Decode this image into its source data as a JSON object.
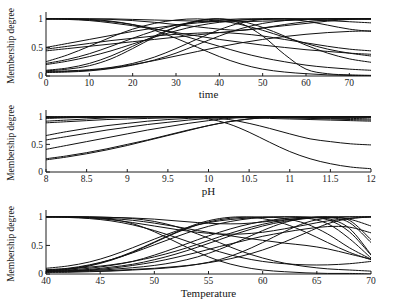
{
  "figure": {
    "title": "",
    "background": "#ffffff",
    "line_color": "#111111",
    "panel_count": 3
  },
  "chart_data": [
    {
      "type": "line",
      "id": "time",
      "title": "",
      "xlabel": "time",
      "ylabel": "Membership degree",
      "xlim": [
        0,
        75
      ],
      "ylim": [
        0,
        1.05
      ],
      "grid": false,
      "legend": "none",
      "xticks": [
        0,
        10,
        20,
        30,
        40,
        50,
        60,
        70
      ],
      "xticklabels": [
        "0",
        "10",
        "20",
        "30",
        "40",
        "50",
        "60",
        "70"
      ],
      "yticks": [
        0,
        0.5,
        1
      ],
      "yticklabels": [
        "0",
        "0.5",
        "1"
      ],
      "x": [
        0,
        5,
        10,
        15,
        20,
        25,
        30,
        35,
        40,
        45,
        50,
        55,
        60,
        65,
        70,
        75
      ],
      "series": [
        {
          "name": "mf1",
          "values": [
            1.0,
            1.0,
            0.99,
            0.96,
            0.9,
            0.8,
            0.66,
            0.5,
            0.34,
            0.21,
            0.12,
            0.07,
            0.04,
            0.02,
            0.01,
            0.01
          ]
        },
        {
          "name": "mf2",
          "values": [
            1.0,
            1.0,
            1.0,
            0.99,
            0.97,
            0.94,
            0.9,
            0.86,
            0.82,
            0.8,
            0.84,
            0.9,
            0.95,
            0.98,
            1.0,
            1.0
          ]
        },
        {
          "name": "mf3",
          "values": [
            0.09,
            0.12,
            0.18,
            0.3,
            0.48,
            0.68,
            0.85,
            0.96,
            1.0,
            0.96,
            0.85,
            0.7,
            0.54,
            0.4,
            0.3,
            0.24
          ]
        },
        {
          "name": "mf4",
          "values": [
            0.08,
            0.09,
            0.11,
            0.15,
            0.22,
            0.33,
            0.48,
            0.65,
            0.81,
            0.93,
            0.99,
            1.0,
            0.96,
            0.89,
            0.82,
            0.78
          ]
        },
        {
          "name": "mf5",
          "values": [
            0.5,
            0.57,
            0.64,
            0.71,
            0.78,
            0.84,
            0.89,
            0.93,
            0.96,
            0.98,
            0.99,
            1.0,
            1.0,
            1.0,
            1.0,
            1.0
          ]
        },
        {
          "name": "mf6",
          "values": [
            0.22,
            0.29,
            0.39,
            0.52,
            0.66,
            0.79,
            0.89,
            0.95,
            0.98,
            1.0,
            1.0,
            1.0,
            1.0,
            1.0,
            1.0,
            1.0
          ]
        },
        {
          "name": "mf7",
          "values": [
            0.44,
            0.48,
            0.52,
            0.56,
            0.6,
            0.64,
            0.68,
            0.72,
            0.76,
            0.8,
            0.84,
            0.88,
            0.92,
            0.96,
            0.99,
            1.0
          ]
        },
        {
          "name": "mf8",
          "values": [
            0.06,
            0.07,
            0.09,
            0.13,
            0.19,
            0.28,
            0.4,
            0.55,
            0.7,
            0.83,
            0.92,
            0.97,
            0.99,
            1.0,
            1.0,
            1.0
          ]
        },
        {
          "name": "mf9",
          "values": [
            1.0,
            0.99,
            0.97,
            0.93,
            0.88,
            0.82,
            0.76,
            0.7,
            0.64,
            0.59,
            0.54,
            0.5,
            0.46,
            0.43,
            0.4,
            0.38
          ]
        },
        {
          "name": "mf10",
          "values": [
            1.0,
            1.0,
            0.98,
            0.95,
            0.9,
            0.83,
            0.74,
            0.63,
            0.52,
            0.41,
            0.32,
            0.25,
            0.19,
            0.15,
            0.12,
            0.1
          ]
        },
        {
          "name": "mf11",
          "values": [
            0.1,
            0.14,
            0.22,
            0.35,
            0.52,
            0.7,
            0.86,
            0.97,
            1.0,
            0.92,
            0.7,
            0.38,
            0.12,
            0.04,
            0.02,
            0.01
          ]
        },
        {
          "name": "mf12",
          "values": [
            0.47,
            0.52,
            0.57,
            0.62,
            0.66,
            0.7,
            0.73,
            0.75,
            0.76,
            0.74,
            0.7,
            0.64,
            0.58,
            0.52,
            0.47,
            0.44
          ]
        },
        {
          "name": "mf13",
          "values": [
            0.25,
            0.37,
            0.52,
            0.68,
            0.82,
            0.92,
            0.98,
            1.0,
            0.97,
            0.9,
            0.8,
            0.68,
            0.57,
            0.47,
            0.4,
            0.35
          ]
        },
        {
          "name": "mf14",
          "values": [
            0.07,
            0.08,
            0.1,
            0.14,
            0.2,
            0.27,
            0.35,
            0.43,
            0.51,
            0.58,
            0.64,
            0.69,
            0.73,
            0.76,
            0.78,
            0.79
          ]
        },
        {
          "name": "mf15",
          "values": [
            1.0,
            1.0,
            1.0,
            1.0,
            0.99,
            0.98,
            0.97,
            0.96,
            0.95,
            0.95,
            0.96,
            0.97,
            0.99,
            1.0,
            1.0,
            1.0
          ]
        },
        {
          "name": "mf16",
          "values": [
            0.2,
            0.26,
            0.34,
            0.44,
            0.56,
            0.68,
            0.79,
            0.88,
            0.94,
            0.98,
            1.0,
            1.0,
            0.99,
            0.97,
            0.95,
            0.93
          ]
        }
      ]
    },
    {
      "type": "line",
      "id": "ph",
      "title": "",
      "xlabel": "pH",
      "ylabel": "Membership degree",
      "xlim": [
        8,
        12
      ],
      "ylim": [
        0,
        1.05
      ],
      "grid": false,
      "legend": "none",
      "xticks": [
        8,
        8.5,
        9,
        9.5,
        10,
        10.5,
        11,
        11.5,
        12
      ],
      "xticklabels": [
        "8",
        "8.5",
        "9",
        "9.5",
        "10",
        "10.5",
        "11",
        "11.5",
        "12"
      ],
      "yticks": [
        0,
        0.5,
        1
      ],
      "yticklabels": [
        "0",
        "0.5",
        "1"
      ],
      "x": [
        8,
        8.25,
        8.5,
        8.75,
        9,
        9.25,
        9.5,
        9.75,
        10,
        10.25,
        10.5,
        10.75,
        11,
        11.25,
        11.5,
        11.75,
        12
      ],
      "series": [
        {
          "name": "mf1",
          "values": [
            1.0,
            1.0,
            1.0,
            1.0,
            1.0,
            1.0,
            1.0,
            1.0,
            1.0,
            1.0,
            1.0,
            1.0,
            1.0,
            1.0,
            1.0,
            1.0,
            1.0
          ]
        },
        {
          "name": "mf2",
          "values": [
            0.99,
            0.99,
            1.0,
            1.0,
            1.0,
            1.0,
            1.0,
            1.0,
            1.0,
            1.0,
            1.0,
            1.0,
            1.0,
            0.99,
            0.99,
            0.99,
            0.99
          ]
        },
        {
          "name": "mf3",
          "values": [
            0.92,
            0.94,
            0.96,
            0.98,
            0.99,
            1.0,
            1.0,
            1.0,
            1.0,
            1.0,
            0.99,
            0.99,
            0.98,
            0.97,
            0.96,
            0.95,
            0.94
          ]
        },
        {
          "name": "mf4",
          "values": [
            0.89,
            0.91,
            0.93,
            0.95,
            0.96,
            0.97,
            0.98,
            0.99,
            0.99,
            0.99,
            0.98,
            0.97,
            0.96,
            0.95,
            0.94,
            0.93,
            0.92
          ]
        },
        {
          "name": "mf5",
          "values": [
            0.66,
            0.73,
            0.79,
            0.84,
            0.88,
            0.92,
            0.95,
            0.97,
            0.99,
            1.0,
            1.0,
            1.0,
            1.0,
            1.0,
            1.0,
            1.0,
            1.0
          ]
        },
        {
          "name": "mf6",
          "values": [
            0.58,
            0.64,
            0.7,
            0.76,
            0.81,
            0.86,
            0.9,
            0.94,
            0.97,
            0.99,
            1.0,
            1.0,
            1.0,
            1.0,
            1.0,
            1.0,
            1.0
          ]
        },
        {
          "name": "mf7",
          "values": [
            0.41,
            0.48,
            0.55,
            0.62,
            0.69,
            0.76,
            0.82,
            0.88,
            0.93,
            0.97,
            0.99,
            1.0,
            1.0,
            1.0,
            1.0,
            1.0,
            1.0
          ]
        },
        {
          "name": "mf8",
          "values": [
            0.24,
            0.29,
            0.35,
            0.42,
            0.5,
            0.58,
            0.67,
            0.76,
            0.84,
            0.91,
            0.96,
            0.99,
            1.0,
            1.0,
            1.0,
            1.0,
            1.0
          ]
        },
        {
          "name": "mf9",
          "values": [
            0.22,
            0.27,
            0.33,
            0.4,
            0.48,
            0.57,
            0.66,
            0.75,
            0.84,
            0.91,
            0.96,
            0.99,
            1.0,
            1.0,
            1.0,
            1.0,
            1.0
          ]
        },
        {
          "name": "mf10",
          "values": [
            0.98,
            0.99,
            0.99,
            1.0,
            1.0,
            1.0,
            1.0,
            1.0,
            0.99,
            0.95,
            0.88,
            0.79,
            0.69,
            0.6,
            0.55,
            0.51,
            0.49
          ]
        },
        {
          "name": "mf11",
          "values": [
            0.97,
            0.98,
            0.99,
            0.99,
            1.0,
            1.0,
            1.0,
            0.99,
            0.96,
            0.87,
            0.72,
            0.54,
            0.37,
            0.24,
            0.15,
            0.09,
            0.06
          ]
        },
        {
          "name": "mf12",
          "values": [
            1.0,
            1.0,
            1.0,
            1.0,
            1.0,
            1.0,
            1.0,
            1.0,
            1.0,
            1.0,
            0.99,
            0.99,
            0.98,
            0.98,
            0.97,
            0.97,
            0.96
          ]
        }
      ]
    },
    {
      "type": "line",
      "id": "temperature",
      "title": "",
      "xlabel": "Temperature",
      "ylabel": "Membership degree",
      "xlim": [
        40,
        70
      ],
      "ylim": [
        0,
        1.05
      ],
      "grid": false,
      "legend": "none",
      "xticks": [
        40,
        45,
        50,
        55,
        60,
        65,
        70
      ],
      "xticklabels": [
        "40",
        "45",
        "50",
        "55",
        "60",
        "65",
        "70"
      ],
      "yticks": [
        0,
        0.5,
        1
      ],
      "yticklabels": [
        "0",
        "0.5",
        "1"
      ],
      "x": [
        40,
        42,
        44,
        46,
        48,
        50,
        52,
        54,
        56,
        58,
        60,
        62,
        64,
        66,
        68,
        70
      ],
      "series": [
        {
          "name": "mf1",
          "values": [
            1.0,
            1.0,
            0.99,
            0.96,
            0.88,
            0.74,
            0.56,
            0.38,
            0.23,
            0.13,
            0.07,
            0.04,
            0.02,
            0.01,
            0.01,
            0.0
          ]
        },
        {
          "name": "mf2",
          "values": [
            1.0,
            1.0,
            1.0,
            0.99,
            0.97,
            0.92,
            0.83,
            0.7,
            0.55,
            0.4,
            0.28,
            0.19,
            0.13,
            0.09,
            0.07,
            0.05
          ]
        },
        {
          "name": "mf3",
          "values": [
            1.0,
            1.0,
            0.99,
            0.97,
            0.94,
            0.89,
            0.83,
            0.76,
            0.7,
            0.64,
            0.59,
            0.54,
            0.5,
            0.44,
            0.35,
            0.26
          ]
        },
        {
          "name": "mf4",
          "values": [
            0.05,
            0.08,
            0.14,
            0.24,
            0.38,
            0.55,
            0.72,
            0.86,
            0.95,
            0.99,
            1.0,
            0.97,
            0.88,
            0.7,
            0.46,
            0.26
          ]
        },
        {
          "name": "mf5",
          "values": [
            0.06,
            0.07,
            0.1,
            0.15,
            0.22,
            0.33,
            0.46,
            0.6,
            0.73,
            0.84,
            0.92,
            0.97,
            0.99,
            0.95,
            0.74,
            0.33
          ]
        },
        {
          "name": "mf6",
          "values": [
            0.1,
            0.14,
            0.21,
            0.32,
            0.46,
            0.61,
            0.75,
            0.86,
            0.93,
            0.97,
            0.99,
            1.0,
            1.0,
            0.97,
            0.8,
            0.34
          ]
        },
        {
          "name": "mf7",
          "values": [
            0.04,
            0.05,
            0.06,
            0.08,
            0.11,
            0.15,
            0.21,
            0.3,
            0.43,
            0.59,
            0.76,
            0.9,
            0.98,
            1.0,
            0.96,
            0.84
          ]
        },
        {
          "name": "mf8",
          "values": [
            0.03,
            0.03,
            0.04,
            0.05,
            0.07,
            0.09,
            0.12,
            0.17,
            0.25,
            0.38,
            0.55,
            0.74,
            0.9,
            0.98,
            1.0,
            1.0
          ]
        },
        {
          "name": "mf9",
          "values": [
            1.0,
            1.0,
            1.0,
            0.99,
            0.98,
            0.96,
            0.93,
            0.9,
            0.88,
            0.88,
            0.91,
            0.95,
            0.98,
            1.0,
            1.0,
            1.0
          ]
        },
        {
          "name": "mf10",
          "values": [
            1.0,
            0.99,
            0.97,
            0.93,
            0.86,
            0.76,
            0.64,
            0.51,
            0.39,
            0.29,
            0.22,
            0.18,
            0.16,
            0.16,
            0.18,
            0.22
          ]
        },
        {
          "name": "mf11",
          "values": [
            0.06,
            0.09,
            0.15,
            0.25,
            0.39,
            0.56,
            0.73,
            0.88,
            0.97,
            1.0,
            0.97,
            0.88,
            0.73,
            0.55,
            0.38,
            0.25
          ]
        },
        {
          "name": "mf12",
          "values": [
            0.07,
            0.1,
            0.16,
            0.25,
            0.37,
            0.51,
            0.65,
            0.78,
            0.88,
            0.95,
            0.99,
            1.0,
            0.98,
            0.88,
            0.62,
            0.28
          ]
        },
        {
          "name": "mf13",
          "values": [
            0.08,
            0.09,
            0.12,
            0.16,
            0.22,
            0.3,
            0.4,
            0.52,
            0.65,
            0.77,
            0.87,
            0.94,
            0.98,
            0.99,
            0.9,
            0.55
          ]
        },
        {
          "name": "mf14",
          "values": [
            1.0,
            1.0,
            0.98,
            0.95,
            0.9,
            0.84,
            0.78,
            0.73,
            0.7,
            0.7,
            0.73,
            0.79,
            0.86,
            0.93,
            0.97,
            1.0
          ]
        },
        {
          "name": "mf15",
          "values": [
            0.05,
            0.06,
            0.08,
            0.12,
            0.17,
            0.25,
            0.35,
            0.47,
            0.6,
            0.73,
            0.84,
            0.92,
            0.97,
            0.99,
            0.94,
            0.6
          ]
        },
        {
          "name": "mf16",
          "values": [
            0.04,
            0.05,
            0.07,
            0.1,
            0.15,
            0.21,
            0.29,
            0.38,
            0.48,
            0.57,
            0.66,
            0.73,
            0.79,
            0.83,
            0.82,
            0.72
          ]
        },
        {
          "name": "mf17",
          "values": [
            0.03,
            0.04,
            0.05,
            0.06,
            0.08,
            0.1,
            0.13,
            0.17,
            0.23,
            0.31,
            0.42,
            0.56,
            0.72,
            0.88,
            0.97,
            1.0
          ]
        }
      ]
    }
  ]
}
